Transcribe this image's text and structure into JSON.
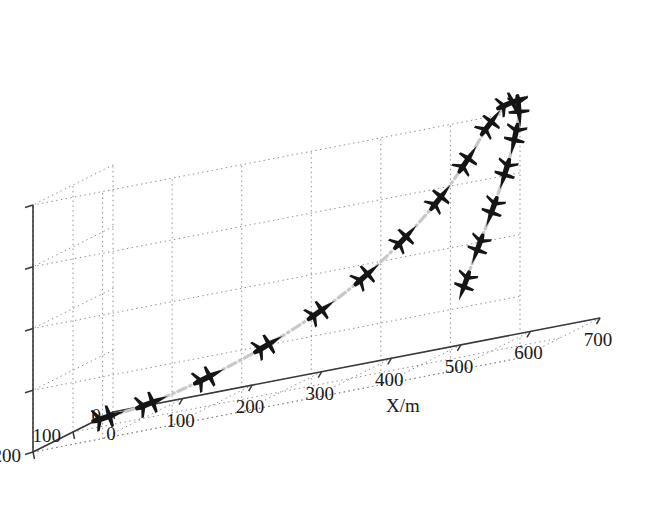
{
  "figure": {
    "type": "3d-trajectory-plot",
    "background": "#ffffff",
    "marker_color": "#151515",
    "trajectory_color": "#c8c8c8",
    "grid_color": "#808080",
    "axis_color": "#3a3a3a"
  },
  "axes": {
    "x": {
      "label": "X/m",
      "ticks": [
        "0",
        "100",
        "200",
        "300",
        "400",
        "500",
        "600",
        "700"
      ],
      "values": [
        0,
        100,
        200,
        300,
        400,
        500,
        600,
        700
      ],
      "range": [
        0,
        700
      ]
    },
    "y": {
      "label": "Y/m",
      "ticks": [
        "0",
        "100",
        "200"
      ],
      "values": [
        0,
        100,
        200
      ],
      "range": [
        0,
        200
      ]
    },
    "z": {
      "label": "Z/m",
      "ticks": [
        "4 000",
        "4 100",
        "4 200",
        "4 300",
        "4 400"
      ],
      "values": [
        4000,
        4100,
        4200,
        4300,
        4400
      ],
      "range": [
        4000,
        4400
      ]
    }
  },
  "chart_data": {
    "type": "scatter",
    "title": "",
    "xlabel": "X/m",
    "ylabel": "Y/m",
    "zlabel": "Z/m",
    "xlim": [
      0,
      700
    ],
    "ylim": [
      0,
      200
    ],
    "zlim": [
      4000,
      4400
    ],
    "grid": true,
    "legend": "none",
    "series": [
      {
        "name": "aircraft trajectory",
        "style": "dash-dot",
        "color": "#c8c8c8",
        "marker": "aircraft-icon",
        "points": [
          {
            "x": 10,
            "y": 30,
            "z": 4000
          },
          {
            "x": 75,
            "y": 35,
            "z": 4010
          },
          {
            "x": 160,
            "y": 40,
            "z": 4035
          },
          {
            "x": 250,
            "y": 48,
            "z": 4070
          },
          {
            "x": 330,
            "y": 55,
            "z": 4110
          },
          {
            "x": 400,
            "y": 62,
            "z": 4155
          },
          {
            "x": 460,
            "y": 70,
            "z": 4205
          },
          {
            "x": 515,
            "y": 78,
            "z": 4260
          },
          {
            "x": 560,
            "y": 88,
            "z": 4315
          },
          {
            "x": 600,
            "y": 100,
            "z": 4370
          },
          {
            "x": 640,
            "y": 118,
            "z": 4400
          },
          {
            "x": 665,
            "y": 142,
            "z": 4390
          },
          {
            "x": 672,
            "y": 165,
            "z": 4350
          },
          {
            "x": 668,
            "y": 182,
            "z": 4300
          },
          {
            "x": 655,
            "y": 192,
            "z": 4245
          },
          {
            "x": 638,
            "y": 198,
            "z": 4190
          },
          {
            "x": 620,
            "y": 200,
            "z": 4135
          }
        ]
      }
    ]
  }
}
